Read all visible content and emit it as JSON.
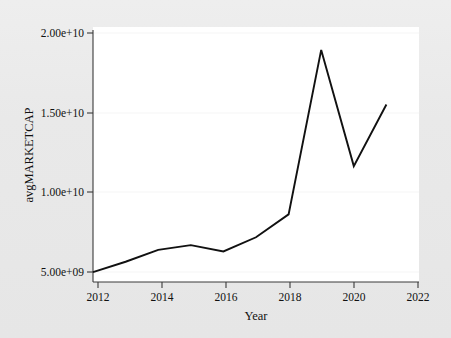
{
  "chart_data": {
    "type": "line",
    "title": "",
    "subtitle": "",
    "xlabel": "Year",
    "ylabel": "avgMARKETCAP",
    "x": [
      2012,
      2013,
      2014,
      2015,
      2016,
      2017,
      2018,
      2019,
      2020,
      2021
    ],
    "values": [
      5000000000.0,
      5650000000.0,
      6400000000.0,
      6700000000.0,
      6300000000.0,
      7200000000.0,
      8650000000.0,
      19050000000.0,
      11700000000.0,
      15600000000.0
    ],
    "series": [
      {
        "name": "avgMARKETCAP",
        "values": [
          5000000000.0,
          5650000000.0,
          6400000000.0,
          6700000000.0,
          6300000000.0,
          7200000000.0,
          8650000000.0,
          19050000000.0,
          11700000000.0,
          15600000000.0
        ]
      }
    ],
    "xlim": [
      2012,
      2022
    ],
    "ylim": [
      4370000000.0,
      20500000000.0
    ],
    "xticks": [
      2012,
      2014,
      2016,
      2018,
      2020,
      2022
    ],
    "xtick_labels": [
      "2012",
      "2014",
      "2016",
      "2018",
      "2020",
      "2022"
    ],
    "yticks": [
      5000000000.0,
      10000000000.0,
      15000000000.0,
      20000000000.0
    ],
    "ytick_labels": [
      "5.00e+09",
      "1.00e+10",
      "1.50e+10",
      "2.00e+10"
    ],
    "grid": false,
    "legend": null,
    "legend_position": "none",
    "line_color": "#111111",
    "plot_background": "#ffffff",
    "figure_background": "#e8e8e8"
  },
  "axes": {
    "x_title": "Year",
    "y_title": "avgMARKETCAP",
    "x_tick_labels": [
      "2012",
      "2014",
      "2016",
      "2018",
      "2020",
      "2022"
    ],
    "y_tick_labels": [
      "5.00e+09",
      "1.00e+10",
      "1.50e+10",
      "2.00e+10"
    ]
  }
}
